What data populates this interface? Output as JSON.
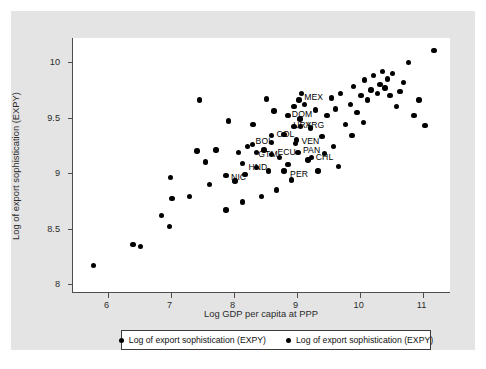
{
  "chart_data": {
    "type": "scatter",
    "title": "",
    "xlabel": "Log GDP per capita at PPP",
    "ylabel": "Log of export sophistication (EXPY)",
    "xlim": [
      5.45,
      11.45
    ],
    "ylim": [
      7.92,
      10.22
    ],
    "xticks": [
      6,
      7,
      8,
      9,
      10,
      11
    ],
    "xtick_labels": [
      "6",
      "7",
      "8",
      "9",
      "10",
      "11"
    ],
    "yticks": [
      8,
      8.5,
      9,
      9.5,
      10
    ],
    "ytick_labels": [
      "8",
      "8.5",
      "9",
      "9.5",
      "10"
    ],
    "grid": false,
    "marker_color": "#000000",
    "legend_position": "bottom",
    "legend": [
      "Log of export sophistication (EXPY)",
      "Log of export sophistication (EXPY)"
    ],
    "points": [
      {
        "x": 5.78,
        "y": 8.17
      },
      {
        "x": 6.4,
        "y": 8.36
      },
      {
        "x": 6.52,
        "y": 8.34
      },
      {
        "x": 6.85,
        "y": 8.62
      },
      {
        "x": 6.98,
        "y": 8.52
      },
      {
        "x": 7.02,
        "y": 8.77
      },
      {
        "x": 7.0,
        "y": 8.96
      },
      {
        "x": 7.3,
        "y": 8.79
      },
      {
        "x": 7.42,
        "y": 9.2
      },
      {
        "x": 7.55,
        "y": 9.1
      },
      {
        "x": 7.62,
        "y": 8.9
      },
      {
        "x": 7.46,
        "y": 9.66
      },
      {
        "x": 7.88,
        "y": 8.67
      },
      {
        "x": 7.92,
        "y": 9.47
      },
      {
        "x": 8.08,
        "y": 9.19
      },
      {
        "x": 8.22,
        "y": 9.24
      },
      {
        "x": 8.18,
        "y": 8.99
      },
      {
        "x": 8.36,
        "y": 9.05
      },
      {
        "x": 8.31,
        "y": 9.44
      },
      {
        "x": 8.52,
        "y": 9.67
      },
      {
        "x": 8.48,
        "y": 9.21
      },
      {
        "x": 8.6,
        "y": 9.28
      },
      {
        "x": 8.55,
        "y": 9.02
      },
      {
        "x": 8.73,
        "y": 9.14
      },
      {
        "x": 8.8,
        "y": 9.35
      },
      {
        "x": 8.86,
        "y": 9.08
      },
      {
        "x": 8.92,
        "y": 8.94
      },
      {
        "x": 8.68,
        "y": 8.85
      },
      {
        "x": 9.05,
        "y": 9.49
      },
      {
        "x": 9.12,
        "y": 9.62
      },
      {
        "x": 9.0,
        "y": 9.3
      },
      {
        "x": 9.22,
        "y": 9.41
      },
      {
        "x": 9.3,
        "y": 9.57
      },
      {
        "x": 9.18,
        "y": 9.12
      },
      {
        "x": 9.4,
        "y": 9.33
      },
      {
        "x": 9.48,
        "y": 9.52
      },
      {
        "x": 9.55,
        "y": 9.68
      },
      {
        "x": 9.62,
        "y": 9.58
      },
      {
        "x": 9.7,
        "y": 9.72
      },
      {
        "x": 9.58,
        "y": 9.24
      },
      {
        "x": 9.78,
        "y": 9.44
      },
      {
        "x": 9.85,
        "y": 9.62
      },
      {
        "x": 9.9,
        "y": 9.78
      },
      {
        "x": 9.96,
        "y": 9.55
      },
      {
        "x": 10.02,
        "y": 9.7
      },
      {
        "x": 10.08,
        "y": 9.84
      },
      {
        "x": 10.12,
        "y": 9.66
      },
      {
        "x": 10.18,
        "y": 9.75
      },
      {
        "x": 10.22,
        "y": 9.88
      },
      {
        "x": 10.28,
        "y": 9.72
      },
      {
        "x": 10.32,
        "y": 9.8
      },
      {
        "x": 10.36,
        "y": 9.92
      },
      {
        "x": 10.4,
        "y": 9.77
      },
      {
        "x": 10.44,
        "y": 9.85
      },
      {
        "x": 10.48,
        "y": 9.7
      },
      {
        "x": 10.52,
        "y": 9.9
      },
      {
        "x": 10.58,
        "y": 9.6
      },
      {
        "x": 10.64,
        "y": 9.74
      },
      {
        "x": 10.7,
        "y": 9.82
      },
      {
        "x": 10.78,
        "y": 10.0
      },
      {
        "x": 10.86,
        "y": 9.52
      },
      {
        "x": 10.94,
        "y": 9.66
      },
      {
        "x": 11.04,
        "y": 9.43
      },
      {
        "x": 11.18,
        "y": 10.11
      },
      {
        "x": 9.34,
        "y": 9.02
      },
      {
        "x": 9.44,
        "y": 9.18
      },
      {
        "x": 9.66,
        "y": 9.06
      },
      {
        "x": 9.88,
        "y": 9.34
      },
      {
        "x": 10.06,
        "y": 9.46
      },
      {
        "x": 8.96,
        "y": 9.6
      },
      {
        "x": 9.08,
        "y": 9.72
      },
      {
        "x": 8.64,
        "y": 9.56
      },
      {
        "x": 7.72,
        "y": 9.21
      },
      {
        "x": 8.02,
        "y": 8.93
      },
      {
        "x": 8.44,
        "y": 8.79
      },
      {
        "x": 8.14,
        "y": 8.74
      }
    ],
    "labeled_points": [
      {
        "code": "MEX",
        "x": 9.04,
        "y": 9.66,
        "dx": 5,
        "dy": -4
      },
      {
        "code": "DOM",
        "x": 8.86,
        "y": 9.52,
        "dx": 4,
        "dy": -3
      },
      {
        "code": "ARG",
        "x": 9.06,
        "y": 9.42,
        "dx": 5,
        "dy": -3
      },
      {
        "code": "URY",
        "x": 8.96,
        "y": 9.42,
        "dx": -1,
        "dy": -3
      },
      {
        "code": "COL",
        "x": 8.6,
        "y": 9.34,
        "dx": 5,
        "dy": -3
      },
      {
        "code": "VEN",
        "x": 8.98,
        "y": 9.27,
        "dx": 6,
        "dy": -3
      },
      {
        "code": "PAN",
        "x": 9.02,
        "y": 9.19,
        "dx": 5,
        "dy": -3
      },
      {
        "code": "CHL",
        "x": 9.24,
        "y": 9.14,
        "dx": 4,
        "dy": -2
      },
      {
        "code": "ECU",
        "x": 8.6,
        "y": 9.17,
        "dx": 6,
        "dy": -3
      },
      {
        "code": "BOL",
        "x": 8.3,
        "y": 9.26,
        "dx": 3,
        "dy": -4
      },
      {
        "code": "GTM",
        "x": 8.36,
        "y": 9.19,
        "dx": 2,
        "dy": 1
      },
      {
        "code": "HND",
        "x": 8.14,
        "y": 9.09,
        "dx": 6,
        "dy": 3
      },
      {
        "code": "PER",
        "x": 8.8,
        "y": 9.02,
        "dx": 6,
        "dy": 2
      },
      {
        "code": "NIC",
        "x": 7.88,
        "y": 8.98,
        "dx": 5,
        "dy": 1
      }
    ]
  }
}
